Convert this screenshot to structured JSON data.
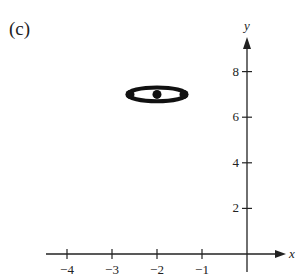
{
  "panel": {
    "label": "(c)"
  },
  "chart_data": {
    "type": "scatter",
    "title": "",
    "xlabel": "x",
    "ylabel": "y",
    "xlim": [
      -4.4,
      0.8
    ],
    "ylim": [
      0,
      9.4
    ],
    "x_ticks": [
      -4,
      -3,
      -2,
      -1
    ],
    "x_tick_labels": [
      "−4",
      "−3",
      "−2",
      "−1"
    ],
    "y_ticks": [
      2,
      4,
      6,
      8
    ],
    "y_tick_labels": [
      "2",
      "4",
      "6",
      "8"
    ],
    "grid": false,
    "shapes": [
      {
        "type": "ellipse",
        "center": [
          -2,
          7
        ],
        "semi_x": 0.65,
        "semi_y": 0.17,
        "stroke": "#111111"
      }
    ],
    "points": [
      {
        "x": -2,
        "y": 7,
        "label": "center"
      },
      {
        "x": -2.6,
        "y": 7,
        "label": "vertex-left"
      },
      {
        "x": -1.4,
        "y": 7,
        "label": "vertex-right"
      }
    ]
  }
}
